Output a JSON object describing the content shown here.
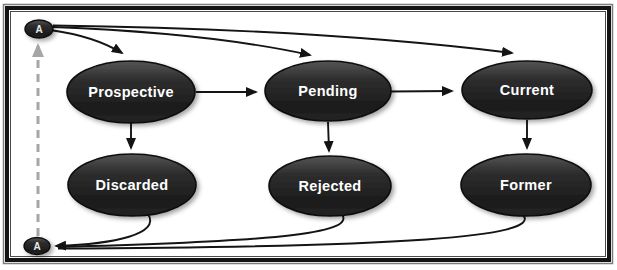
{
  "diagram": {
    "type": "state-flow",
    "connectors": {
      "top": {
        "label": "A"
      },
      "bottom": {
        "label": "A"
      }
    },
    "states": {
      "top_row": [
        "Prospective",
        "Pending",
        "Current"
      ],
      "bottom_row": [
        "Discarded",
        "Rejected",
        "Former"
      ]
    },
    "edges": [
      {
        "from": "connector-A-top",
        "to": "Prospective",
        "style": "solid-arrow"
      },
      {
        "from": "connector-A-top",
        "to": "Pending",
        "style": "solid-arrow"
      },
      {
        "from": "connector-A-top",
        "to": "Current",
        "style": "solid-arrow"
      },
      {
        "from": "Prospective",
        "to": "Pending",
        "style": "solid-arrow"
      },
      {
        "from": "Pending",
        "to": "Current",
        "style": "solid-arrow"
      },
      {
        "from": "Prospective",
        "to": "Discarded",
        "style": "solid-arrow"
      },
      {
        "from": "Pending",
        "to": "Rejected",
        "style": "solid-arrow"
      },
      {
        "from": "Current",
        "to": "Former",
        "style": "solid-arrow"
      },
      {
        "from": "Discarded",
        "to": "connector-A-bottom",
        "style": "solid-arrow"
      },
      {
        "from": "Rejected",
        "to": "connector-A-bottom",
        "style": "solid-arrow"
      },
      {
        "from": "Former",
        "to": "connector-A-bottom",
        "style": "solid-arrow"
      },
      {
        "from": "connector-A-bottom",
        "to": "connector-A-top",
        "style": "dashed-gray-arrow"
      }
    ],
    "colors": {
      "node_fill_dark": "#1d1d1d",
      "node_fill_light": "#4e4e4e",
      "node_stroke": "#0d0d0d",
      "node_text": "#ffffff",
      "arrow": "#141414",
      "dashed_connector": "#a6a6a6",
      "frame_border": "#141414",
      "background": "#ffffff"
    }
  }
}
